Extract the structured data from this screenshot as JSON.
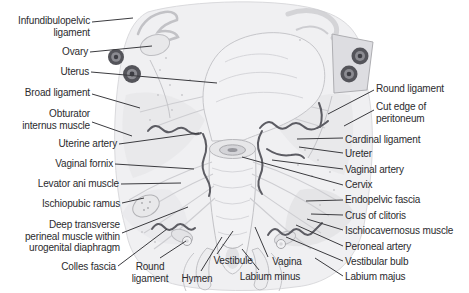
{
  "colors": {
    "background": "#ffffff",
    "label_text": "#2b2b2e",
    "leader_line": "#3b3b3f",
    "vessel": "#5c5c63",
    "tissue_light": "#f0f0f2",
    "tissue_mid": "#e4e4e7",
    "outline": "#c2c2c6",
    "ring_dark": "#54545a"
  },
  "labels": [
    {
      "id": "infundibulopelvic-ligament",
      "text": "Infundibulopelvic\nligament",
      "x": 90,
      "y": 15,
      "align": "right",
      "leader": [
        [
          92,
          22
        ],
        [
          133,
          18
        ]
      ]
    },
    {
      "id": "ovary",
      "text": "Ovary",
      "x": 88,
      "y": 46,
      "align": "right",
      "leader": [
        [
          90,
          52
        ],
        [
          152,
          46
        ]
      ]
    },
    {
      "id": "uterus",
      "text": "Uterus",
      "x": 89,
      "y": 66,
      "align": "right",
      "leader": [
        [
          91,
          72
        ],
        [
          217,
          83
        ]
      ]
    },
    {
      "id": "broad-ligament",
      "text": "Broad ligament",
      "x": 90,
      "y": 87,
      "align": "right",
      "leader": [
        [
          92,
          94
        ],
        [
          140,
          108
        ]
      ]
    },
    {
      "id": "obturator-internus-muscle",
      "text": "Obturator\ninternus muscle",
      "x": 90,
      "y": 108,
      "align": "right",
      "leader": [
        [
          92,
          122
        ],
        [
          132,
          136
        ]
      ]
    },
    {
      "id": "uterine-artery",
      "text": "Uterine artery",
      "x": 117,
      "y": 138,
      "align": "right",
      "leader": [
        [
          119,
          144
        ],
        [
          199,
          133
        ]
      ]
    },
    {
      "id": "vaginal-fornix",
      "text": "Vaginal fornix",
      "x": 113,
      "y": 158,
      "align": "right",
      "leader": [
        [
          115,
          164
        ],
        [
          194,
          169
        ]
      ]
    },
    {
      "id": "levator-ani-muscle",
      "text": "Levator ani muscle",
      "x": 119,
      "y": 178,
      "align": "right",
      "leader": [
        [
          121,
          184
        ],
        [
          181,
          183
        ]
      ]
    },
    {
      "id": "ischiopubic-ramus",
      "text": "Ischiopubic ramus",
      "x": 120,
      "y": 198,
      "align": "right",
      "leader": [
        [
          122,
          203
        ],
        [
          144,
          198
        ]
      ]
    },
    {
      "id": "deep-transverse-perineal",
      "text": "Deep transverse\nperineal muscle within\nurogenital diaphragm",
      "x": 120,
      "y": 219,
      "align": "right",
      "leader": [
        [
          122,
          233
        ],
        [
          188,
          207
        ]
      ]
    },
    {
      "id": "colles-fascia",
      "text": "Colles fascia",
      "x": 116,
      "y": 261,
      "align": "right",
      "leader": [
        [
          118,
          266
        ],
        [
          167,
          229
        ]
      ]
    },
    {
      "id": "round-ligament-bottom",
      "text": "Round\nligament",
      "x": 150,
      "y": 261,
      "align": "center",
      "leader": [
        [
          160,
          258
        ],
        [
          186,
          241
        ]
      ]
    },
    {
      "id": "hymen",
      "text": "Hymen",
      "x": 197,
      "y": 273,
      "align": "center",
      "leader": [
        [
          201,
          271
        ],
        [
          222,
          237
        ]
      ]
    },
    {
      "id": "vestibule",
      "text": "Vestibule",
      "x": 233,
      "y": 255,
      "align": "center",
      "leader": [
        [
          217,
          254
        ],
        [
          233,
          231
        ]
      ]
    },
    {
      "id": "vagina",
      "text": "Vagina",
      "x": 287,
      "y": 256,
      "align": "center",
      "leader": [
        [
          268,
          257
        ],
        [
          255,
          227
        ]
      ]
    },
    {
      "id": "labium-minus",
      "text": "Labium minus",
      "x": 270,
      "y": 271,
      "align": "center",
      "leader": [
        [
          259,
          270
        ],
        [
          242,
          249
        ]
      ]
    },
    {
      "id": "round-ligament-right",
      "text": "Round ligament",
      "x": 376,
      "y": 83,
      "align": "left",
      "leader": [
        [
          374,
          90
        ],
        [
          328,
          114
        ]
      ]
    },
    {
      "id": "cut-edge-of-peritoneum",
      "text": "Cut edge of\nperitoneum",
      "x": 376,
      "y": 101,
      "align": "left",
      "leader": [
        [
          374,
          110
        ],
        [
          344,
          126
        ]
      ]
    },
    {
      "id": "cardinal-ligament",
      "text": "Cardinal ligament",
      "x": 345,
      "y": 134,
      "align": "left",
      "leader": [
        [
          343,
          138
        ],
        [
          297,
          139
        ]
      ]
    },
    {
      "id": "ureter",
      "text": "Ureter",
      "x": 345,
      "y": 148,
      "align": "left",
      "leader": [
        [
          343,
          153
        ],
        [
          299,
          147
        ]
      ]
    },
    {
      "id": "vaginal-artery",
      "text": "Vaginal artery",
      "x": 345,
      "y": 164,
      "align": "left",
      "leader": [
        [
          343,
          169
        ],
        [
          272,
          160
        ]
      ]
    },
    {
      "id": "cervix",
      "text": "Cervix",
      "x": 345,
      "y": 179,
      "align": "left",
      "leader": [
        [
          343,
          185
        ],
        [
          242,
          157
        ]
      ]
    },
    {
      "id": "endopelvic-fascia",
      "text": "Endopelvic fascia",
      "x": 345,
      "y": 194,
      "align": "left",
      "leader": [
        [
          343,
          200
        ],
        [
          306,
          201
        ]
      ]
    },
    {
      "id": "crus-of-clitoris",
      "text": "Crus of clitoris",
      "x": 345,
      "y": 210,
      "align": "left",
      "leader": [
        [
          343,
          215
        ],
        [
          311,
          214
        ]
      ]
    },
    {
      "id": "ischiocavernosus-muscle",
      "text": "Ischiocavernosus muscle",
      "x": 345,
      "y": 225,
      "align": "left",
      "leader": [
        [
          343,
          230
        ],
        [
          307,
          219
        ]
      ]
    },
    {
      "id": "peroneal-artery",
      "text": "Peroneal artery",
      "x": 345,
      "y": 241,
      "align": "left",
      "leader": [
        [
          343,
          246
        ],
        [
          296,
          225
        ]
      ]
    },
    {
      "id": "vestibular-bulb",
      "text": "Vestibular bulb",
      "x": 345,
      "y": 256,
      "align": "left",
      "leader": [
        [
          343,
          261
        ],
        [
          286,
          237
        ]
      ]
    },
    {
      "id": "labium-majus",
      "text": "Labium majus",
      "x": 345,
      "y": 271,
      "align": "left",
      "leader": [
        [
          343,
          276
        ],
        [
          315,
          258
        ]
      ]
    }
  ]
}
